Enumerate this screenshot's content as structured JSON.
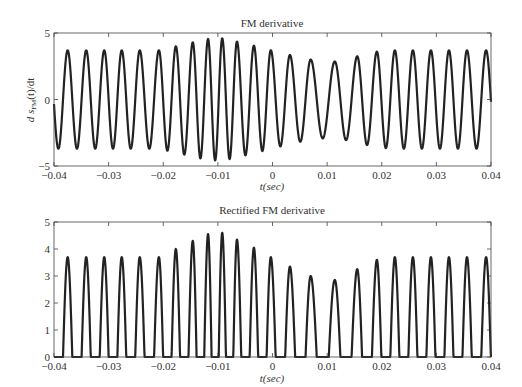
{
  "chart_data": [
    {
      "type": "line",
      "title": "FM derivative",
      "xlabel": "t(sec)",
      "ylabel": "d s_FM(t)/dt",
      "xlim": [
        -0.04,
        0.04
      ],
      "ylim": [
        -5,
        5
      ],
      "xticks": [
        -0.04,
        -0.03,
        -0.02,
        -0.01,
        0,
        0.01,
        0.02,
        0.03,
        0.04
      ],
      "xtick_labels": [
        "-0.04",
        "-0.03",
        "-0.02",
        "-0.01",
        "0",
        "0.01",
        "0.02",
        "0.03",
        "0.04"
      ],
      "yticks": [
        -5,
        0,
        5
      ],
      "ytick_labels": [
        "-5",
        "0",
        "5"
      ],
      "grid": false,
      "series": [
        {
          "name": "FM derivative",
          "color": "#222222",
          "peak_times": [
            -0.0375,
            -0.0341,
            -0.0308,
            -0.0276,
            -0.0243,
            -0.0208,
            -0.0177,
            -0.0146,
            -0.0118,
            -0.0092,
            -0.0065,
            -0.0034,
            -0.0003,
            0.0032,
            0.007,
            0.0114,
            0.0155,
            0.0191,
            0.0224,
            0.0257,
            0.029,
            0.0323,
            0.0356,
            0.0391
          ],
          "peak_values": [
            3.7,
            3.7,
            3.7,
            3.7,
            3.7,
            3.7,
            4.0,
            4.3,
            4.55,
            4.6,
            4.35,
            4.05,
            3.7,
            3.35,
            3.0,
            2.85,
            3.25,
            3.6,
            3.7,
            3.7,
            3.7,
            3.7,
            3.7,
            3.7
          ],
          "rectified": false
        }
      ]
    },
    {
      "type": "line",
      "title": "Rectified FM derivative",
      "xlabel": "t(sec)",
      "ylabel": "",
      "xlim": [
        -0.04,
        0.04
      ],
      "ylim": [
        0,
        5
      ],
      "xticks": [
        -0.04,
        -0.03,
        -0.02,
        -0.01,
        0,
        0.01,
        0.02,
        0.03,
        0.04
      ],
      "xtick_labels": [
        "-0.04",
        "-0.03",
        "-0.02",
        "-0.01",
        "0",
        "0.01",
        "0.02",
        "0.03",
        "0.04"
      ],
      "yticks": [
        0,
        1,
        2,
        3,
        4,
        5
      ],
      "ytick_labels": [
        "0",
        "1",
        "2",
        "3",
        "4",
        "5"
      ],
      "grid": false,
      "series": [
        {
          "name": "Rectified FM derivative",
          "color": "#222222",
          "peak_times": [
            -0.0375,
            -0.0341,
            -0.0308,
            -0.0276,
            -0.0243,
            -0.0208,
            -0.0177,
            -0.0146,
            -0.0118,
            -0.0092,
            -0.0065,
            -0.0034,
            -0.0003,
            0.0032,
            0.007,
            0.0114,
            0.0155,
            0.0191,
            0.0224,
            0.0257,
            0.029,
            0.0323,
            0.0356,
            0.0391
          ],
          "peak_values": [
            3.7,
            3.7,
            3.7,
            3.7,
            3.7,
            3.7,
            4.0,
            4.3,
            4.55,
            4.6,
            4.35,
            4.05,
            3.7,
            3.35,
            3.0,
            2.85,
            3.25,
            3.6,
            3.7,
            3.7,
            3.7,
            3.7,
            3.7,
            3.7
          ],
          "rectified": true
        }
      ]
    }
  ],
  "plots": {
    "top": {
      "title": "FM derivative",
      "xlabel": "t(sec)",
      "ylabel_main": "d s",
      "ylabel_sub": "FM",
      "ylabel_tail": "(t)/dt"
    },
    "bottom": {
      "title": "Rectified FM derivative",
      "xlabel": "t(sec)"
    }
  }
}
